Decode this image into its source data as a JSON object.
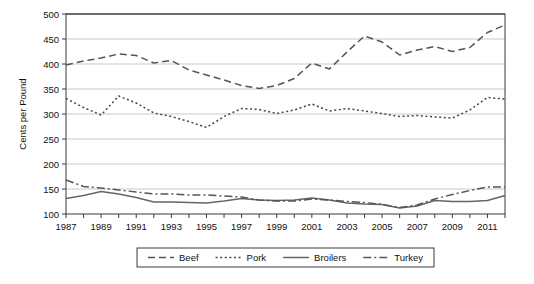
{
  "chart_data": {
    "type": "line",
    "title": "",
    "xlabel": "",
    "ylabel": "Cents per Pound",
    "xlim": [
      1987,
      2012
    ],
    "ylim": [
      100,
      500
    ],
    "ytick_step": 50,
    "yticks": [
      100,
      150,
      200,
      250,
      300,
      350,
      400,
      450,
      500
    ],
    "xticks_major": [
      1987,
      1989,
      1991,
      1993,
      1995,
      1997,
      1999,
      2001,
      2003,
      2005,
      2007,
      2009,
      2011
    ],
    "xticks_all": [
      1987,
      1988,
      1989,
      1990,
      1991,
      1992,
      1993,
      1994,
      1995,
      1996,
      1997,
      1998,
      1999,
      2000,
      2001,
      2002,
      2003,
      2004,
      2005,
      2006,
      2007,
      2008,
      2009,
      2010,
      2011,
      2012
    ],
    "grid": "horizontal",
    "legend_position": "bottom-outside",
    "x": [
      1987,
      1988,
      1989,
      1990,
      1991,
      1992,
      1993,
      1994,
      1995,
      1996,
      1997,
      1998,
      1999,
      2000,
      2001,
      2002,
      2003,
      2004,
      2005,
      2006,
      2007,
      2008,
      2009,
      2010,
      2011,
      2012
    ],
    "series": [
      {
        "name": "Beef",
        "dash": "dashed",
        "color": "#555555",
        "values": [
          398,
          406,
          412,
          420,
          417,
          402,
          407,
          388,
          378,
          368,
          357,
          351,
          357,
          371,
          402,
          390,
          424,
          456,
          444,
          418,
          428,
          435,
          425,
          433,
          463,
          478
        ]
      },
      {
        "name": "Pork",
        "dash": "dotted",
        "color": "#444444",
        "values": [
          331,
          313,
          298,
          336,
          322,
          302,
          295,
          285,
          273,
          295,
          311,
          309,
          301,
          308,
          320,
          306,
          311,
          306,
          301,
          295,
          297,
          294,
          292,
          308,
          333,
          330
        ]
      },
      {
        "name": "Broilers",
        "dash": "solid",
        "color": "#666666",
        "values": [
          131,
          137,
          145,
          140,
          133,
          124,
          124,
          123,
          122,
          126,
          131,
          128,
          127,
          128,
          132,
          128,
          122,
          120,
          119,
          112,
          116,
          127,
          125,
          125,
          127,
          137
        ]
      },
      {
        "name": "Turkey",
        "dash": "dashdot",
        "color": "#555555",
        "values": [
          168,
          155,
          152,
          148,
          144,
          140,
          140,
          138,
          138,
          136,
          134,
          128,
          126,
          126,
          130,
          128,
          125,
          123,
          119,
          113,
          118,
          130,
          139,
          147,
          154,
          154
        ]
      }
    ]
  },
  "legend": {
    "items": [
      {
        "label": "Beef"
      },
      {
        "label": "Pork"
      },
      {
        "label": "Broilers"
      },
      {
        "label": "Turkey"
      }
    ]
  }
}
